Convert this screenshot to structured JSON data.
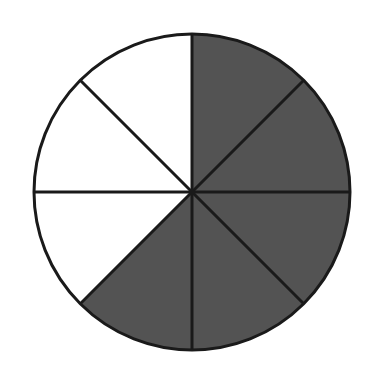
{
  "figure": {
    "title": "Circle divided into eight equal sectors with five shaded",
    "type": "fraction-circle",
    "background_color": "#ffffff",
    "outline_color": "#1a1a1a",
    "shaded_color": "#535353",
    "unshaded_color": "#ffffff",
    "outline_width_px": 3,
    "divider_width_px": 3,
    "center_x": 192,
    "center_y": 192,
    "radius": 158,
    "total_sectors": 8,
    "shaded_count": 5,
    "unshaded_count": 3,
    "sector_angle_degrees": 45,
    "fraction_shaded": "5/8",
    "sectors": [
      {
        "id": "sector-1",
        "index": 1,
        "start_deg": 0,
        "end_deg": 45,
        "position": "north-to-northeast",
        "shaded": true,
        "fill": "#535353"
      },
      {
        "id": "sector-2",
        "index": 2,
        "start_deg": 45,
        "end_deg": 90,
        "position": "northeast-to-east",
        "shaded": true,
        "fill": "#535353"
      },
      {
        "id": "sector-3",
        "index": 3,
        "start_deg": 90,
        "end_deg": 135,
        "position": "east-to-southeast",
        "shaded": true,
        "fill": "#535353"
      },
      {
        "id": "sector-4",
        "index": 4,
        "start_deg": 135,
        "end_deg": 180,
        "position": "southeast-to-south",
        "shaded": true,
        "fill": "#535353"
      },
      {
        "id": "sector-5",
        "index": 5,
        "start_deg": 180,
        "end_deg": 225,
        "position": "south-to-southwest",
        "shaded": true,
        "fill": "#535353"
      },
      {
        "id": "sector-6",
        "index": 6,
        "start_deg": 225,
        "end_deg": 270,
        "position": "southwest-to-west",
        "shaded": false,
        "fill": "#ffffff"
      },
      {
        "id": "sector-7",
        "index": 7,
        "start_deg": 270,
        "end_deg": 315,
        "position": "west-to-northwest",
        "shaded": false,
        "fill": "#ffffff"
      },
      {
        "id": "sector-8",
        "index": 8,
        "start_deg": 315,
        "end_deg": 360,
        "position": "northwest-to-north",
        "shaded": false,
        "fill": "#ffffff"
      }
    ],
    "dividers": [
      {
        "id": "divider-vertical",
        "angle_deg": 0,
        "label": "vertical diameter"
      },
      {
        "id": "divider-diagonal-ne",
        "angle_deg": 45,
        "label": "northeast-southwest diameter"
      },
      {
        "id": "divider-horizontal",
        "angle_deg": 90,
        "label": "horizontal diameter"
      },
      {
        "id": "divider-diagonal-se",
        "angle_deg": 135,
        "label": "southeast-northwest diameter"
      }
    ]
  },
  "chart_data": {
    "type": "pie",
    "title": "Circle divided into eight equal sectors with five shaded",
    "categories": [
      "sector-1",
      "sector-2",
      "sector-3",
      "sector-4",
      "sector-5",
      "sector-6",
      "sector-7",
      "sector-8"
    ],
    "values": [
      12.5,
      12.5,
      12.5,
      12.5,
      12.5,
      12.5,
      12.5,
      12.5
    ],
    "colors": [
      "#535353",
      "#535353",
      "#535353",
      "#535353",
      "#535353",
      "#ffffff",
      "#ffffff",
      "#ffffff"
    ],
    "shaded": [
      true,
      true,
      true,
      true,
      true,
      false,
      false,
      false
    ],
    "fraction_shaded": "5/8",
    "start_angle_deg": 0,
    "direction": "clockwise",
    "xlabel": "",
    "ylabel": "",
    "legend": "none",
    "grid": false
  }
}
